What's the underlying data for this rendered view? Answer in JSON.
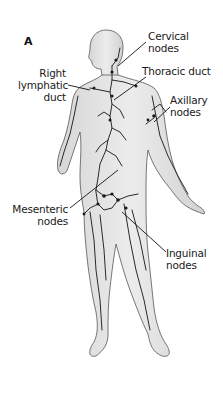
{
  "figure": {
    "panel_label": "A",
    "colors": {
      "body_fill": "#e4e4e4",
      "body_outline": "#555555",
      "vessel": "#2a2a2a",
      "leader": "#111111"
    }
  },
  "labels": [
    {
      "id": "cervical",
      "line1": "Cervical",
      "line2": "nodes"
    },
    {
      "id": "right-lymphatic",
      "line1": "Right",
      "line2": "lymphatic",
      "line3": "duct"
    },
    {
      "id": "thoracic",
      "line1": "Thoracic duct"
    },
    {
      "id": "axillary",
      "line1": "Axillary",
      "line2": "nodes"
    },
    {
      "id": "mesenteric",
      "line1": "Mesenteric",
      "line2": "nodes"
    },
    {
      "id": "inguinal",
      "line1": "Inguinal",
      "line2": "nodes"
    }
  ]
}
